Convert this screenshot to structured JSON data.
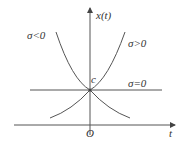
{
  "diagram": {
    "axes": {
      "y_label": "x(t)",
      "x_label": "t",
      "origin_label": "O"
    },
    "intercept_label": "c",
    "curves": [
      {
        "label": "σ<0",
        "shape": "decaying exponential"
      },
      {
        "label": "σ>0",
        "shape": "growing exponential"
      },
      {
        "label": "σ=0",
        "shape": "constant line"
      }
    ]
  },
  "colors": {
    "line": "#555555",
    "text": "#333333"
  }
}
